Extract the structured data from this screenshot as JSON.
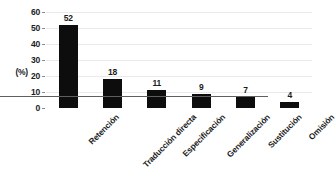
{
  "chart_data": {
    "type": "bar",
    "title": "",
    "xlabel": "",
    "ylabel": "(%)",
    "ylim": [
      0,
      60
    ],
    "ytick_values": [
      0,
      10,
      20,
      30,
      40,
      50,
      60
    ],
    "ytick_labels": [
      "0",
      "10",
      "20",
      "30",
      "40",
      "50",
      "60"
    ],
    "grid": true,
    "legend": "none",
    "bar_color": "#0d0d0d",
    "gridline_color": "#e9e9e9",
    "axis_color": "#5f5f5f",
    "label_rotation": -45,
    "show_data_labels": true,
    "categories": [
      "Retención",
      "Traducción directa",
      "Especificación",
      "Generalización",
      "Sustitución",
      "Omisión"
    ],
    "values": [
      52,
      18,
      11,
      9,
      7,
      4
    ],
    "data_labels": [
      "52",
      "18",
      "11",
      "9",
      "7",
      "4"
    ]
  }
}
